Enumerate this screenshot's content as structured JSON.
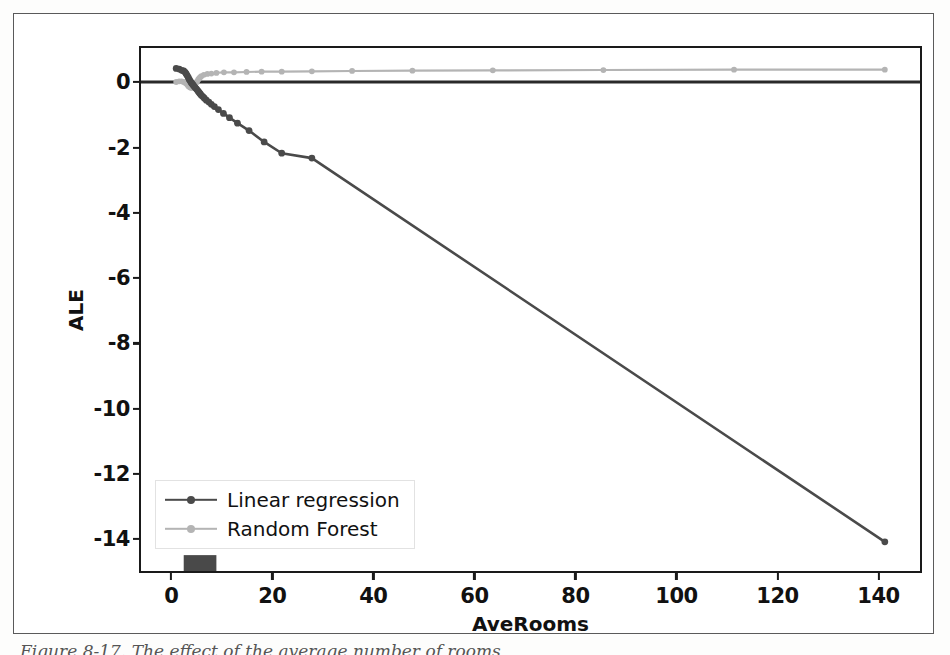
{
  "figure": {
    "caption": "Figure 8-17. The effect of the average number of rooms",
    "legend_position": "lower-left"
  },
  "chart_data": {
    "type": "line",
    "title": "",
    "xlabel": "AveRooms",
    "ylabel": "ALE",
    "xlim": [
      -6,
      149
    ],
    "ylim": [
      -15.1,
      1.05
    ],
    "xticks": [
      0,
      20,
      40,
      60,
      80,
      100,
      120,
      140
    ],
    "xticklabels": [
      "0",
      "20",
      "40",
      "60",
      "80",
      "100",
      "120",
      "140"
    ],
    "yticks": [
      0,
      -2,
      -4,
      -6,
      -8,
      -10,
      -12,
      -14
    ],
    "yticklabels": [
      "0",
      "-2",
      "-4",
      "-6",
      "-8",
      "-10",
      "-12",
      "-14"
    ],
    "grid": false,
    "zero_line": true,
    "rug": {
      "label": "rug-plot",
      "x_range": [
        2.5,
        9.0
      ],
      "color": "#3a3a3a"
    },
    "series": [
      {
        "name": "Linear regression",
        "color": "#4a4a4a",
        "marker": "circle",
        "x": [
          1.0,
          1.6,
          2.1,
          2.5,
          2.8,
          3.0,
          3.2,
          3.4,
          3.6,
          3.8,
          4.0,
          4.2,
          4.4,
          4.6,
          4.8,
          5.0,
          5.2,
          5.4,
          5.6,
          5.8,
          6.0,
          6.3,
          6.6,
          7.0,
          7.5,
          8.0,
          8.6,
          9.4,
          10.4,
          11.6,
          13.2,
          15.5,
          18.5,
          22.0,
          28.0,
          142.0
        ],
        "y": [
          0.42,
          0.4,
          0.36,
          0.34,
          0.3,
          0.25,
          0.2,
          0.14,
          0.08,
          0.03,
          -0.02,
          -0.06,
          -0.1,
          -0.14,
          -0.18,
          -0.21,
          -0.25,
          -0.29,
          -0.33,
          -0.37,
          -0.41,
          -0.45,
          -0.5,
          -0.56,
          -0.62,
          -0.69,
          -0.76,
          -0.85,
          -0.97,
          -1.1,
          -1.27,
          -1.5,
          -1.85,
          -2.2,
          -2.35,
          -14.2
        ]
      },
      {
        "name": "Random Forest",
        "color": "#b4b4b4",
        "marker": "circle",
        "x": [
          1.0,
          1.6,
          2.1,
          2.5,
          2.8,
          3.0,
          3.2,
          3.4,
          3.6,
          3.8,
          4.0,
          4.2,
          4.4,
          4.6,
          4.8,
          5.0,
          5.2,
          5.4,
          5.6,
          5.8,
          6.0,
          6.5,
          7.2,
          8.0,
          9.0,
          10.5,
          12.5,
          15.0,
          18.0,
          22.0,
          28.0,
          36.0,
          48.0,
          64.0,
          86.0,
          112.0,
          142.0
        ],
        "y": [
          0.0,
          0.02,
          0.02,
          0.0,
          -0.02,
          -0.05,
          -0.08,
          -0.12,
          -0.15,
          -0.17,
          -0.18,
          -0.17,
          -0.14,
          -0.1,
          -0.06,
          -0.02,
          0.03,
          0.08,
          0.12,
          0.15,
          0.18,
          0.22,
          0.25,
          0.26,
          0.28,
          0.3,
          0.3,
          0.31,
          0.32,
          0.32,
          0.33,
          0.34,
          0.35,
          0.36,
          0.37,
          0.38,
          0.38
        ]
      }
    ],
    "legend": [
      "Linear regression",
      "Random Forest"
    ]
  }
}
